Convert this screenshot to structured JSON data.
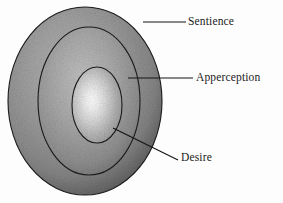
{
  "figure": {
    "type": "concentric-ellipse-diagram",
    "background_color": "#fdfdfd",
    "label_color": "#1b1b1b",
    "leader_line_color": "#141414",
    "outline_color": "#1a1a1a",
    "ring_colors": {
      "outer": "#8d8d8d",
      "outer_shadow": "#4a4a4a",
      "middle": "#9a9a9a",
      "inner_core": "#fbfbfb"
    },
    "layers": [
      {
        "id": "outer",
        "label": "Sentience",
        "cx": 85,
        "cy": 101,
        "rx": 77,
        "ry": 94
      },
      {
        "id": "middle",
        "label": "Apperception",
        "cx": 89,
        "cy": 101,
        "rx": 51,
        "ry": 74
      },
      {
        "id": "inner",
        "label": "Desire",
        "cx": 97,
        "cy": 105,
        "rx": 25,
        "ry": 38
      }
    ],
    "leaders": [
      {
        "id": "sentience",
        "label": "Sentience",
        "x1": 143,
        "y1": 22,
        "x2": 186,
        "y2": 22
      },
      {
        "id": "apperception",
        "label": "Apperception",
        "x1": 128,
        "y1": 78,
        "x2": 193,
        "y2": 78
      },
      {
        "id": "desire",
        "label": "Desire",
        "x1": 113,
        "y1": 128,
        "x2": 178,
        "y2": 160
      }
    ],
    "labels": {
      "sentience": "Sentience",
      "apperception": "Apperception",
      "desire": "Desire"
    }
  }
}
